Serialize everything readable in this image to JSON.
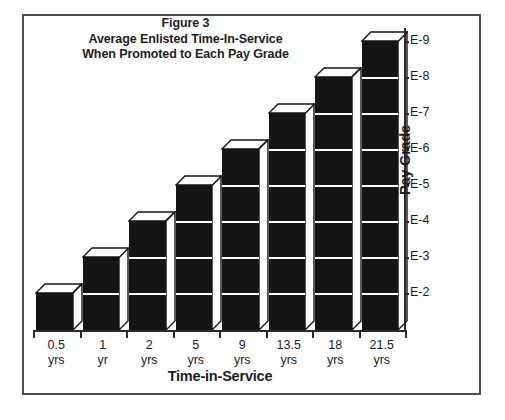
{
  "chart_data": {
    "type": "bar",
    "title": "Figure 3\nAverage Enlisted Time-In-Service\nWhen Promoted to Each Pay Grade",
    "title_lines": [
      "Figure 3",
      "Average Enlisted Time-In-Service",
      "When Promoted to Each Pay Grade"
    ],
    "xlabel": "Time-in-Service",
    "ylabel": "Pay Grade",
    "grid": true,
    "legend": "none",
    "style": "3d-column",
    "bar_color": "#141416",
    "bar_face_color": "#ffffff",
    "frame_color": "#4d4d52",
    "axis_color": "#2b2b2e",
    "categories": [
      "0.5 yrs",
      "1 yr",
      "2 yrs",
      "5 yrs",
      "9 yrs",
      "13.5 yrs",
      "18 yrs",
      "21.5 yrs"
    ],
    "category_values": [
      {
        "value": "0.5",
        "unit": "yrs"
      },
      {
        "value": "1",
        "unit": "yr"
      },
      {
        "value": "2",
        "unit": "yrs"
      },
      {
        "value": "5",
        "unit": "yrs"
      },
      {
        "value": "9",
        "unit": "yrs"
      },
      {
        "value": "13.5",
        "unit": "yrs"
      },
      {
        "value": "18",
        "unit": "yrs"
      },
      {
        "value": "21.5",
        "unit": "yrs"
      }
    ],
    "x_numeric_years": [
      0.5,
      1,
      2,
      5,
      9,
      13.5,
      18,
      21.5
    ],
    "ytick_labels": [
      "E-2",
      "E-3",
      "E-4",
      "E-5",
      "E-6",
      "E-7",
      "E-8",
      "E-9"
    ],
    "ytick_values": [
      2,
      3,
      4,
      5,
      6,
      7,
      8,
      9
    ],
    "ylim": [
      1,
      9
    ],
    "values": [
      2,
      3,
      4,
      5,
      6,
      7,
      8,
      9
    ],
    "value_labels": [
      "E-2",
      "E-3",
      "E-4",
      "E-5",
      "E-6",
      "E-7",
      "E-8",
      "E-9"
    ],
    "series": [
      {
        "name": "Pay Grade",
        "values": [
          2,
          3,
          4,
          5,
          6,
          7,
          8,
          9
        ]
      }
    ],
    "points": [
      {
        "time_in_service": "0.5 yrs",
        "pay_grade": "E-2"
      },
      {
        "time_in_service": "1 yr",
        "pay_grade": "E-3"
      },
      {
        "time_in_service": "2 yrs",
        "pay_grade": "E-4"
      },
      {
        "time_in_service": "5 yrs",
        "pay_grade": "E-5"
      },
      {
        "time_in_service": "9 yrs",
        "pay_grade": "E-6"
      },
      {
        "time_in_service": "13.5 yrs",
        "pay_grade": "E-7"
      },
      {
        "time_in_service": "18 yrs",
        "pay_grade": "E-8"
      },
      {
        "time_in_service": "21.5 yrs",
        "pay_grade": "E-9"
      }
    ]
  }
}
